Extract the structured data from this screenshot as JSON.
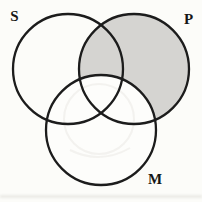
{
  "diagram": {
    "type": "venn-three-circles",
    "labels": {
      "s": "S",
      "p": "P",
      "m": "M"
    },
    "colors": {
      "page_background": "#fcfcf9",
      "shaded_region": "#d5d4d1",
      "unshaded_fill": "#fdfdfb",
      "stroke": "#1c1c1c",
      "label": "#161616"
    },
    "shading_description": "P circle shaded gray except the region overlapping M; S and M regions unshaded"
  }
}
